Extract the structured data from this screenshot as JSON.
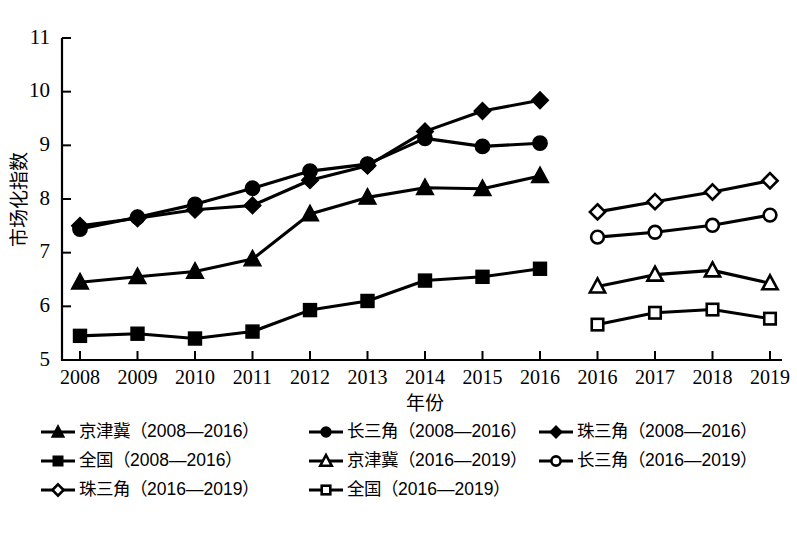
{
  "chart_data": {
    "type": "line",
    "title": "",
    "xlabel": "年份",
    "ylabel": "市场化指数",
    "ylim": [
      5,
      11
    ],
    "yticks": [
      5,
      6,
      7,
      8,
      9,
      10,
      11
    ],
    "grid": false,
    "legend_position": "bottom",
    "x_tick_labels": [
      "2008",
      "2009",
      "2010",
      "2011",
      "2012",
      "2013",
      "2014",
      "2015",
      "2016",
      "2016",
      "2017",
      "2018",
      "2019"
    ],
    "panels": [
      {
        "name": "2008—2016",
        "categories": [
          "2008",
          "2009",
          "2010",
          "2011",
          "2012",
          "2013",
          "2014",
          "2015",
          "2016"
        ]
      },
      {
        "name": "2016—2019",
        "categories": [
          "2016",
          "2017",
          "2018",
          "2019"
        ]
      }
    ],
    "series": [
      {
        "name": "京津冀（2008—2016）",
        "marker": "triangle-filled",
        "panel": "2008—2016",
        "x": [
          "2008",
          "2009",
          "2010",
          "2011",
          "2012",
          "2013",
          "2014",
          "2015",
          "2016"
        ],
        "values": [
          6.45,
          6.55,
          6.65,
          6.88,
          7.72,
          8.03,
          8.21,
          8.19,
          8.43
        ]
      },
      {
        "name": "长三角（2008—2016）",
        "marker": "circle-filled",
        "panel": "2008—2016",
        "x": [
          "2008",
          "2009",
          "2010",
          "2011",
          "2012",
          "2013",
          "2014",
          "2015",
          "2016"
        ],
        "values": [
          7.44,
          7.66,
          7.9,
          8.2,
          8.52,
          8.65,
          9.13,
          8.98,
          9.04
        ]
      },
      {
        "name": "珠三角（2008—2016）",
        "marker": "diamond-filled",
        "panel": "2008—2016",
        "x": [
          "2008",
          "2009",
          "2010",
          "2011",
          "2012",
          "2013",
          "2014",
          "2015",
          "2016"
        ],
        "values": [
          7.5,
          7.64,
          7.8,
          7.88,
          8.35,
          8.62,
          9.26,
          9.64,
          9.84
        ]
      },
      {
        "name": "全国（2008—2016）",
        "marker": "square-filled",
        "panel": "2008—2016",
        "x": [
          "2008",
          "2009",
          "2010",
          "2011",
          "2012",
          "2013",
          "2014",
          "2015",
          "2016"
        ],
        "values": [
          5.45,
          5.49,
          5.4,
          5.53,
          5.93,
          6.1,
          6.48,
          6.55,
          6.7
        ]
      },
      {
        "name": "京津冀（2016—2019）",
        "marker": "triangle-hollow",
        "panel": "2016—2019",
        "x": [
          "2016",
          "2017",
          "2018",
          "2019"
        ],
        "values": [
          6.37,
          6.59,
          6.67,
          6.43
        ]
      },
      {
        "name": "长三角（2016—2019）",
        "marker": "circle-hollow",
        "panel": "2016—2019",
        "x": [
          "2016",
          "2017",
          "2018",
          "2019"
        ],
        "values": [
          7.29,
          7.38,
          7.51,
          7.7
        ]
      },
      {
        "name": "珠三角（2016—2019）",
        "marker": "diamond-hollow",
        "panel": "2016—2019",
        "x": [
          "2016",
          "2017",
          "2018",
          "2019"
        ],
        "values": [
          7.76,
          7.95,
          8.13,
          8.34
        ]
      },
      {
        "name": "全国（2016—2019）",
        "marker": "square-hollow",
        "panel": "2016—2019",
        "x": [
          "2016",
          "2017",
          "2018",
          "2019"
        ],
        "values": [
          5.66,
          5.88,
          5.94,
          5.77
        ]
      }
    ]
  },
  "axes": {
    "y_label": "市场化指数",
    "x_label": "年份",
    "y_ticks": [
      "11",
      "10",
      "9",
      "8",
      "7",
      "6",
      "5"
    ],
    "x_ticks": [
      "2008",
      "2009",
      "2010",
      "2011",
      "2012",
      "2013",
      "2014",
      "2015",
      "2016",
      "2016",
      "2017",
      "2018",
      "2019"
    ]
  },
  "legend": {
    "items": [
      {
        "label": "京津冀（2008—2016）",
        "marker": "triangle-filled",
        "col": "a"
      },
      {
        "label": "长三角（2008—2016）",
        "marker": "circle-filled",
        "col": "b"
      },
      {
        "label": "珠三角（2008—2016）",
        "marker": "diamond-filled",
        "col": "c"
      },
      {
        "label": "全国（2008—2016）",
        "marker": "square-filled",
        "col": "a"
      },
      {
        "label": "京津冀（2016—2019）",
        "marker": "triangle-hollow",
        "col": "b"
      },
      {
        "label": "长三角（2016—2019）",
        "marker": "circle-hollow",
        "col": "c"
      },
      {
        "label": "珠三角（2016—2019）",
        "marker": "diamond-hollow",
        "col": "a"
      },
      {
        "label": "全国（2016—2019）",
        "marker": "square-hollow",
        "col": "b"
      }
    ]
  },
  "caption": {
    "text": ""
  }
}
